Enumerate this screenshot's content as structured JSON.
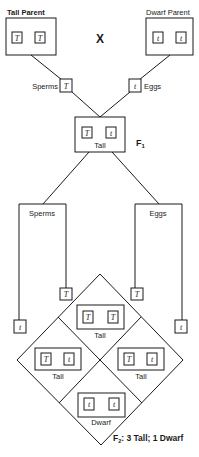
{
  "parents": {
    "tall": {
      "label": "Tall Parent",
      "alleles": [
        "T",
        "T"
      ]
    },
    "cross_symbol": "X",
    "dwarf": {
      "label": "Dwarf Parent",
      "alleles": [
        "t",
        "t"
      ]
    }
  },
  "gametes_p": {
    "sperm": {
      "label": "Sperms",
      "allele": "T"
    },
    "egg": {
      "label": "Eggs",
      "allele": "t"
    }
  },
  "f1": {
    "label": "F",
    "label_sub": "1",
    "alleles": [
      "T",
      "t"
    ],
    "phenotype": "Tall"
  },
  "f1_gametes": {
    "sperm_label": "Sperms",
    "egg_label": "Eggs",
    "sperm_alleles": [
      "T",
      "t"
    ],
    "egg_alleles": [
      "T",
      "t"
    ]
  },
  "f2": {
    "cells": [
      {
        "position": "top",
        "alleles": [
          "T",
          "T"
        ],
        "phenotype": "Tall"
      },
      {
        "position": "left",
        "alleles": [
          "T",
          "t"
        ],
        "phenotype": "Tall"
      },
      {
        "position": "right",
        "alleles": [
          "T",
          "t"
        ],
        "phenotype": "Tall"
      },
      {
        "position": "bottom",
        "alleles": [
          "t",
          "t"
        ],
        "phenotype": "Dwarf"
      }
    ],
    "summary_prefix": "F",
    "summary_sub": "2",
    "summary_text": ": 3 Tall; 1 Dwarf"
  }
}
